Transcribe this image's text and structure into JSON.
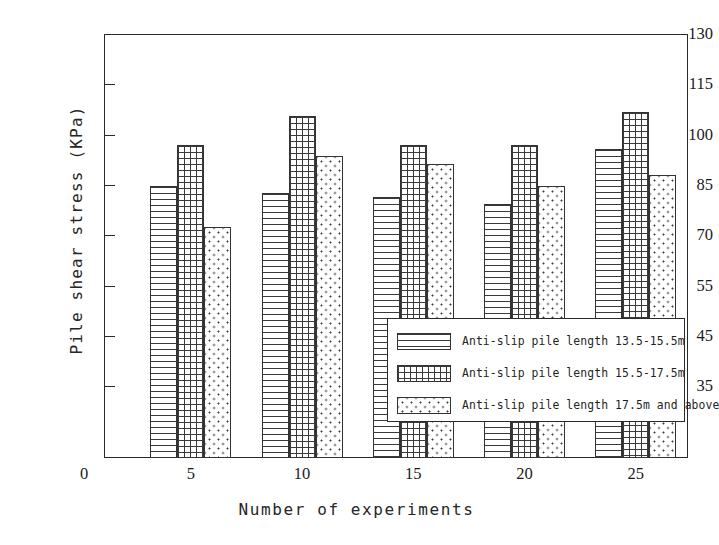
{
  "chart_data": {
    "type": "bar",
    "title": "",
    "xlabel": "Number of experiments",
    "ylabel": "Pile shear stress (KPa)",
    "categories": [
      "5",
      "10",
      "15",
      "20",
      "25"
    ],
    "x_ticks": [
      "0",
      "5",
      "10",
      "15",
      "20",
      "25"
    ],
    "y_ticks": [
      35,
      45,
      55,
      70,
      85,
      100,
      115,
      130
    ],
    "y_tick_labels": [
      "35",
      "45",
      "55",
      "70",
      "85",
      "100",
      "115",
      "130"
    ],
    "ylim": [
      30,
      130
    ],
    "grid": false,
    "legend_position": "center-right-inside",
    "series": [
      {
        "name": "Anti-slip pile length 13.5-15.5m",
        "pattern": "horizontal-lines",
        "values": [
          89,
          87,
          86,
          84,
          99
        ]
      },
      {
        "name": "Anti-slip pile length 15.5-17.5m",
        "pattern": "cross-hatch",
        "values": [
          100,
          108,
          100,
          100,
          109
        ]
      },
      {
        "name": "Anti-slip pile length 17.5m and above",
        "pattern": "dots",
        "values": [
          78,
          97,
          95,
          89,
          92
        ]
      }
    ]
  },
  "legend": {
    "items": [
      {
        "label": "Anti-slip pile length 13.5-15.5m",
        "pattern": "horizontal-lines"
      },
      {
        "label": "Anti-slip pile length 15.5-17.5m",
        "pattern": "cross-hatch"
      },
      {
        "label": "Anti-slip pile length 17.5m and above",
        "pattern": "dots"
      }
    ]
  },
  "colors": {
    "axis": "#2a2a2a",
    "pattern": "#3a3a3a",
    "background": "#ffffff",
    "text": "#1a1a1a"
  }
}
